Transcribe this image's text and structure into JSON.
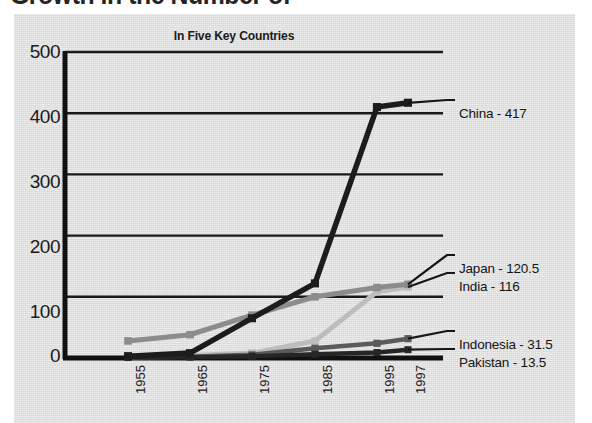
{
  "headline": {
    "text": "Growth in the Number of"
  },
  "chart": {
    "title": "In Five Key Countries"
  },
  "chart_data": {
    "type": "line",
    "title": "In Five Key Countries",
    "xlabel": "",
    "ylabel": "",
    "x": [
      "1955",
      "1965",
      "1975",
      "1985",
      "1995",
      "1997"
    ],
    "ylim": [
      0,
      500
    ],
    "yticks": [
      "0",
      "100",
      "200",
      "300",
      "400",
      "500"
    ],
    "grid": true,
    "legend_position": "right-inline-labels",
    "series": [
      {
        "name": "China",
        "end_label": "China - 417",
        "end_value": 417,
        "color": "#1c1c1c",
        "values": [
          3,
          8,
          65,
          122,
          410,
          417
        ]
      },
      {
        "name": "Japan",
        "end_label": "Japan - 120.5",
        "end_value": 120.5,
        "color": "#8c8c8c",
        "values": [
          28,
          38,
          70,
          100,
          115,
          120.5
        ]
      },
      {
        "name": "India",
        "end_label": "India - 116",
        "end_value": 116,
        "color": "#bdbdbd",
        "values": [
          2,
          4,
          8,
          28,
          108,
          116
        ]
      },
      {
        "name": "Indonesia",
        "end_label": "Indonesia - 31.5",
        "end_value": 31.5,
        "color": "#5a5a5a",
        "values": [
          1,
          2,
          5,
          16,
          24,
          31.5
        ]
      },
      {
        "name": "Pakistan",
        "end_label": "Pakistan - 13.5",
        "end_value": 13.5,
        "color": "#262626",
        "values": [
          1,
          1.5,
          3,
          6,
          9,
          13.5
        ]
      }
    ]
  }
}
